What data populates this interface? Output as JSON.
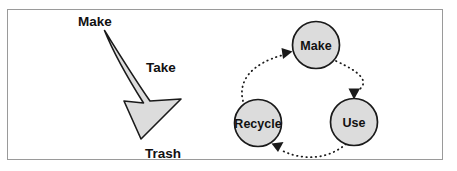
{
  "figure": {
    "frame": {
      "border_color": "#9a9a9a",
      "background": "#ffffff"
    },
    "colors": {
      "shape_fill": "#dcdcdc",
      "shape_stroke": "#1a1a1a",
      "text": "#111111",
      "dotted_arrow": "#1a1a1a"
    },
    "left_diagram": {
      "name": "linear-flow",
      "type": "curved-arrow",
      "labels": {
        "start": "Make",
        "middle": "Take",
        "end": "Trash"
      }
    },
    "right_diagram": {
      "name": "circular-flow",
      "type": "cycle",
      "nodes": [
        {
          "id": "make",
          "label": "Make"
        },
        {
          "id": "use",
          "label": "Use"
        },
        {
          "id": "recycle",
          "label": "Recycle"
        }
      ],
      "connections": [
        {
          "from": "Make",
          "to": "Use",
          "style": "dotted-arrow"
        },
        {
          "from": "Use",
          "to": "Recycle",
          "style": "dotted-arrow"
        },
        {
          "from": "Recycle",
          "to": "Make",
          "style": "dotted-arrow"
        }
      ]
    }
  }
}
